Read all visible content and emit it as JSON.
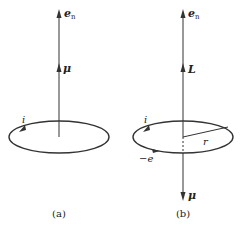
{
  "figure": {
    "colors": {
      "stroke": "#333333",
      "text": "#222222",
      "background": "#ffffff"
    },
    "panel_a": {
      "caption": "(a)",
      "axis_label": "e",
      "axis_label_sub": "n",
      "vector_label": "μ",
      "current_label": "i"
    },
    "panel_b": {
      "caption": "(b)",
      "axis_label": "e",
      "axis_label_sub": "n",
      "angular_momentum_label": "L",
      "current_label": "i",
      "charge_label": "−e",
      "radius_label": "r",
      "moment_label": "μ"
    }
  }
}
